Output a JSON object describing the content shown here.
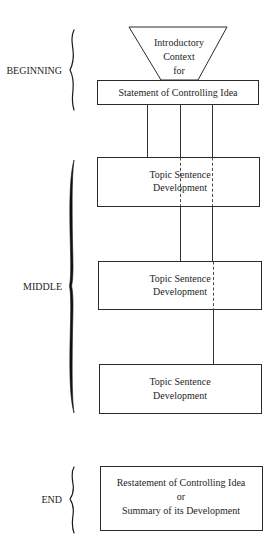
{
  "diagram": {
    "type": "essay-structure",
    "sections": [
      {
        "id": "beginning",
        "label": "BEGINNING"
      },
      {
        "id": "middle",
        "label": "MIDDLE"
      },
      {
        "id": "end",
        "label": "END"
      }
    ],
    "funnel": {
      "lines": [
        "Introductory",
        "Context",
        "for"
      ]
    },
    "thesis_box": {
      "label": "Statement of Controlling Idea"
    },
    "body_boxes": [
      {
        "line1": "Topic Sentence",
        "line2": "Development"
      },
      {
        "line1": "Topic Sentence",
        "line2": "Development"
      },
      {
        "line1": "Topic Sentence",
        "line2": "Development"
      }
    ],
    "conclusion_box": {
      "line1": "Restatement of Controlling Idea",
      "line2": "or",
      "line3": "Summary of its Development"
    },
    "colors": {
      "background": "#ffffff",
      "ink": "#1e1e1e"
    }
  }
}
